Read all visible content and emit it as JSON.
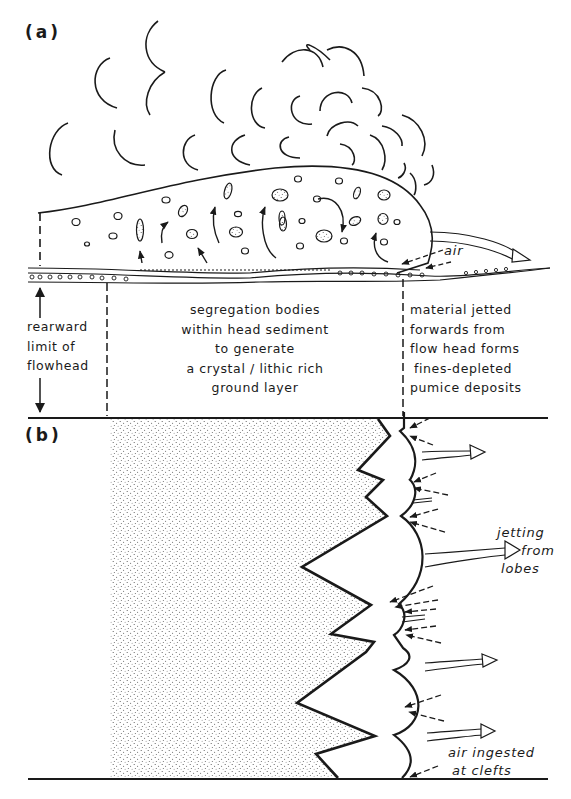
{
  "figure": {
    "panel_a": {
      "label": "(a)",
      "annotations": {
        "air": "air",
        "rearward": [
          "rearward",
          "limit of",
          "flowhead"
        ],
        "segregation": [
          "segregation bodies",
          "within head sediment",
          "to generate",
          "a crystal / lithic rich",
          "ground layer"
        ],
        "jetted": [
          "material jetted",
          "forwards from",
          "flow head forms",
          "fines-depleted",
          "pumice deposits"
        ]
      }
    },
    "panel_b": {
      "label": "(b)",
      "annotations": {
        "jetting": [
          "jetting",
          "from",
          "lobes"
        ],
        "ingested": [
          "air ingested",
          "at clefts"
        ]
      }
    },
    "colors": {
      "ink": "#1a1a1a",
      "background": "#ffffff",
      "stipple": "#555555"
    }
  }
}
